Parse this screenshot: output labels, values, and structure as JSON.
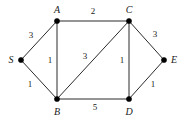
{
  "diagram": {
    "type": "weighted-undirected-graph",
    "width": 185,
    "height": 123,
    "background_color": "#ffffff",
    "edge_color": "#2b2b2b",
    "node_color": "#000000",
    "text_color": "#1a1a1a",
    "nodes": [
      {
        "id": "S",
        "label": "S",
        "x": 21,
        "y": 60,
        "label_x": 11,
        "label_y": 60
      },
      {
        "id": "A",
        "label": "A",
        "x": 57,
        "y": 21,
        "label_x": 57,
        "label_y": 10
      },
      {
        "id": "C",
        "label": "C",
        "x": 129,
        "y": 21,
        "label_x": 129,
        "label_y": 10
      },
      {
        "id": "B",
        "label": "B",
        "x": 57,
        "y": 99,
        "label_x": 57,
        "label_y": 112
      },
      {
        "id": "D",
        "label": "D",
        "x": 129,
        "y": 99,
        "label_x": 129,
        "label_y": 112
      },
      {
        "id": "E",
        "label": "E",
        "x": 164,
        "y": 60,
        "label_x": 174,
        "label_y": 60
      }
    ],
    "edges": [
      {
        "from": "S",
        "to": "A",
        "weight": "3",
        "x1": 21,
        "y1": 60,
        "x2": 57,
        "y2": 21,
        "label_x": 31,
        "label_y": 35
      },
      {
        "from": "S",
        "to": "B",
        "weight": "1",
        "x1": 21,
        "y1": 60,
        "x2": 57,
        "y2": 99,
        "label_x": 30,
        "label_y": 84
      },
      {
        "from": "A",
        "to": "C",
        "weight": "2",
        "x1": 57,
        "y1": 21,
        "x2": 129,
        "y2": 21,
        "label_x": 93,
        "label_y": 11
      },
      {
        "from": "A",
        "to": "B",
        "weight": "1",
        "x1": 57,
        "y1": 21,
        "x2": 57,
        "y2": 99,
        "label_x": 50,
        "label_y": 60
      },
      {
        "from": "B",
        "to": "C",
        "weight": "3",
        "x1": 57,
        "y1": 99,
        "x2": 129,
        "y2": 21,
        "label_x": 85,
        "label_y": 56
      },
      {
        "from": "C",
        "to": "D",
        "weight": "1",
        "x1": 129,
        "y1": 21,
        "x2": 129,
        "y2": 99,
        "label_x": 122,
        "label_y": 60
      },
      {
        "from": "B",
        "to": "D",
        "weight": "5",
        "x1": 57,
        "y1": 99,
        "x2": 129,
        "y2": 99,
        "label_x": 95,
        "label_y": 107
      },
      {
        "from": "C",
        "to": "E",
        "weight": "3",
        "x1": 129,
        "y1": 21,
        "x2": 164,
        "y2": 60,
        "label_x": 155,
        "label_y": 34
      },
      {
        "from": "D",
        "to": "E",
        "weight": "1",
        "x1": 129,
        "y1": 99,
        "x2": 164,
        "y2": 60,
        "label_x": 153,
        "label_y": 84
      }
    ]
  }
}
